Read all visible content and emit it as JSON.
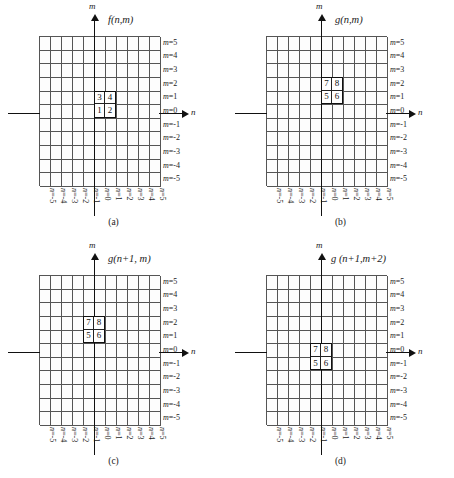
{
  "figure": {
    "axis_m_label": "m",
    "axis_n_label": "n",
    "grid_columns": 11,
    "grid_rows": 11,
    "n_ticks": [
      "n=-5",
      "n=-4",
      "n=-3",
      "n=-2",
      "n=-1",
      "n=0",
      "n=1",
      "n=2",
      "n=3",
      "n=4",
      "n=5"
    ],
    "m_ticks": [
      "m=5",
      "m=4",
      "m=3",
      "m=2",
      "m=1",
      "m=0",
      "m=-1",
      "m=-2",
      "m=-3",
      "m=-4",
      "m=-5"
    ],
    "colors": {
      "grid_line": "#555555",
      "axis": "#111111",
      "block_border": "#111111",
      "background": "#ffffff"
    }
  },
  "chart_data": {
    "type": "heatmap",
    "xlabel": "n",
    "ylabel": "m",
    "xlim": [
      -5,
      5
    ],
    "ylim": [
      -5,
      5
    ],
    "grid": true,
    "legend": "none",
    "panels": [
      {
        "id": "a",
        "caption": "(a)",
        "title": "f(n,m)",
        "values": [
          {
            "n": 0,
            "m": 0,
            "value": "1"
          },
          {
            "n": 1,
            "m": 0,
            "value": "2"
          },
          {
            "n": 0,
            "m": 1,
            "value": "3"
          },
          {
            "n": 1,
            "m": 1,
            "value": "4"
          }
        ]
      },
      {
        "id": "b",
        "caption": "(b)",
        "title": "g(n,m)",
        "values": [
          {
            "n": 0,
            "m": 1,
            "value": "5"
          },
          {
            "n": 1,
            "m": 1,
            "value": "6"
          },
          {
            "n": 0,
            "m": 2,
            "value": "7"
          },
          {
            "n": 1,
            "m": 2,
            "value": "8"
          }
        ]
      },
      {
        "id": "c",
        "caption": "(c)",
        "title": "g(n+1, m)",
        "values": [
          {
            "n": -1,
            "m": 1,
            "value": "5"
          },
          {
            "n": 0,
            "m": 1,
            "value": "6"
          },
          {
            "n": -1,
            "m": 2,
            "value": "7"
          },
          {
            "n": 0,
            "m": 2,
            "value": "8"
          }
        ]
      },
      {
        "id": "d",
        "caption": "(d)",
        "title": "g (n+1,m+2)",
        "values": [
          {
            "n": -1,
            "m": -1,
            "value": "5"
          },
          {
            "n": 0,
            "m": -1,
            "value": "6"
          },
          {
            "n": -1,
            "m": 0,
            "value": "7"
          },
          {
            "n": 0,
            "m": 0,
            "value": "8"
          }
        ]
      }
    ]
  },
  "panels": {
    "a": {
      "caption": "(a)",
      "title": "f(n,m)",
      "block": {
        "top_left": "3",
        "top_right": "4",
        "bottom_left": "1",
        "bottom_right": "2"
      },
      "block_origin": {
        "n": 0,
        "m_top": 1
      }
    },
    "b": {
      "caption": "(b)",
      "title": "g(n,m)",
      "block": {
        "top_left": "7",
        "top_right": "8",
        "bottom_left": "5",
        "bottom_right": "6"
      },
      "block_origin": {
        "n": 0,
        "m_top": 2
      }
    },
    "c": {
      "caption": "(c)",
      "title": "g(n+1, m)",
      "block": {
        "top_left": "7",
        "top_right": "8",
        "bottom_left": "5",
        "bottom_right": "6"
      },
      "block_origin": {
        "n": -1,
        "m_top": 2
      }
    },
    "d": {
      "caption": "(d)",
      "title": "g (n+1,m+2)",
      "block": {
        "top_left": "7",
        "top_right": "8",
        "bottom_left": "5",
        "bottom_right": "6"
      },
      "block_origin": {
        "n": -1,
        "m_top": 0
      }
    }
  }
}
